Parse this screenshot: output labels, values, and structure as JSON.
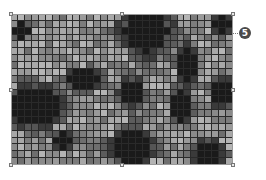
{
  "image": {
    "description": "Grayscale pixelated mosaic image inside a selection frame with resize handles and a numbered callout",
    "grid": {
      "left": 11,
      "top": 14,
      "width": 222,
      "height": 151,
      "cols": 32,
      "rows": 22,
      "base_colors": [
        "#8a8a8a",
        "#9a9a9a",
        "#a8a8a8",
        "#b4b4b4",
        "#7c7c7c",
        "#6e6e6e"
      ],
      "dark_color": "#1a1a1a",
      "mid_dark_color": "#3a3a3a",
      "dark_blobs": [
        {
          "c": 19,
          "r": 2,
          "rc": 3.6,
          "rr": 3.6
        },
        {
          "c": 3,
          "r": 13,
          "rc": 3.8,
          "rr": 3.2
        },
        {
          "c": 10,
          "r": 9,
          "rc": 2.4,
          "rr": 1.6
        },
        {
          "c": 17,
          "r": 11,
          "rc": 1.8,
          "rr": 2.2
        },
        {
          "c": 25,
          "r": 7,
          "rc": 1.6,
          "rr": 3.0
        },
        {
          "c": 17,
          "r": 19,
          "rc": 3.0,
          "rr": 3.0
        },
        {
          "c": 28,
          "r": 20,
          "rc": 2.2,
          "rr": 2.0
        },
        {
          "c": 24,
          "r": 13,
          "rc": 1.6,
          "rr": 2.4
        },
        {
          "c": 1,
          "r": 2,
          "rc": 1.2,
          "rr": 1.2
        },
        {
          "c": 30,
          "r": 1,
          "rc": 1.2,
          "rr": 1.5
        },
        {
          "c": 7,
          "r": 18,
          "rc": 1.6,
          "rr": 1.4
        },
        {
          "c": 30,
          "r": 11,
          "rc": 1.6,
          "rr": 2.2
        }
      ]
    }
  },
  "selection": {
    "handles": [
      {
        "name": "top-left",
        "x": 11,
        "y": 14
      },
      {
        "name": "top-middle",
        "x": 122,
        "y": 14
      },
      {
        "name": "top-right",
        "x": 233,
        "y": 14
      },
      {
        "name": "middle-left",
        "x": 11,
        "y": 90
      },
      {
        "name": "middle-right",
        "x": 233,
        "y": 90
      },
      {
        "name": "bottom-left",
        "x": 11,
        "y": 165
      },
      {
        "name": "bottom-middle",
        "x": 122,
        "y": 165
      },
      {
        "name": "bottom-right",
        "x": 233,
        "y": 165
      }
    ]
  },
  "callout": {
    "label": "5",
    "line_from_x": 233,
    "line_to_x": 238,
    "y": 33,
    "badge_x": 239,
    "badge_y": 27
  }
}
